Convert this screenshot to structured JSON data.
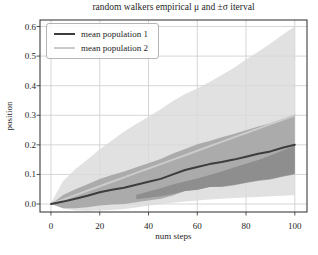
{
  "figure": {
    "background": "#ffffff",
    "spine_color": "#2b2b2b",
    "grid_color": "#cccccc",
    "text_color": "#1f1f1f"
  },
  "chart_data": {
    "type": "area",
    "title": "random walkers empirical μ and ±σ iterval",
    "xlabel": "num steps",
    "ylabel": "position",
    "grid": true,
    "xlim": [
      -4.5,
      105
    ],
    "ylim": [
      -0.027,
      0.622
    ],
    "xticks": [
      0,
      20,
      40,
      60,
      80,
      100
    ],
    "xtick_labels": [
      "0",
      "20",
      "40",
      "60",
      "80",
      "100"
    ],
    "yticks": [
      0.0,
      0.1,
      0.2,
      0.3,
      0.4,
      0.5,
      0.6
    ],
    "ytick_labels": [
      "0.0",
      "0.1",
      "0.2",
      "0.3",
      "0.4",
      "0.5",
      "0.6"
    ],
    "legend": {
      "position": "upper left",
      "entries": [
        {
          "label": "mean population 1",
          "color": "#3d3d3d"
        },
        {
          "label": "mean population 2",
          "color": "#cbcbcb"
        }
      ]
    },
    "series": [
      {
        "id": "population-2-sigma-band",
        "name": "population 2 ±σ band",
        "role": "band",
        "color": "#d9d9d9",
        "opacity": 0.8,
        "x": [
          0,
          5,
          10,
          15,
          20,
          25,
          30,
          35,
          40,
          45,
          50,
          55,
          60,
          65,
          70,
          75,
          80,
          85,
          90,
          95,
          100
        ],
        "top": [
          0.004,
          0.078,
          0.118,
          0.15,
          0.185,
          0.215,
          0.245,
          0.27,
          0.295,
          0.32,
          0.348,
          0.372,
          0.39,
          0.412,
          0.436,
          0.46,
          0.488,
          0.515,
          0.543,
          0.572,
          0.6
        ],
        "bottom": [
          0.0,
          -0.015,
          -0.022,
          -0.024,
          -0.022,
          -0.02,
          -0.017,
          -0.012,
          -0.006,
          0.0,
          0.004,
          0.008,
          0.012,
          0.015,
          0.018,
          0.02,
          0.022,
          0.024,
          0.026,
          0.028,
          0.03
        ]
      },
      {
        "id": "population-1-sigma-band",
        "name": "population 1 ±σ band",
        "role": "band",
        "color": "#a6a6a6",
        "opacity": 0.92,
        "x": [
          0,
          5,
          10,
          15,
          20,
          25,
          30,
          35,
          40,
          45,
          50,
          55,
          60,
          65,
          70,
          75,
          80,
          85,
          90,
          95,
          100
        ],
        "top": [
          0.0,
          0.03,
          0.05,
          0.067,
          0.085,
          0.098,
          0.11,
          0.124,
          0.138,
          0.152,
          0.171,
          0.186,
          0.202,
          0.213,
          0.226,
          0.237,
          0.249,
          0.262,
          0.273,
          0.287,
          0.3
        ],
        "bottom": [
          0.0,
          -0.014,
          -0.014,
          -0.011,
          -0.005,
          -0.002,
          0.0,
          0.006,
          0.012,
          0.018,
          0.029,
          0.044,
          0.048,
          0.057,
          0.058,
          0.063,
          0.071,
          0.078,
          0.083,
          0.092,
          0.1
        ]
      },
      {
        "id": "band-overlap-region",
        "name": "band overlap (darker region)",
        "role": "band",
        "color": "#8c8c8c",
        "opacity": 0.95,
        "x": [
          35,
          40,
          45,
          50,
          55,
          60,
          65,
          70,
          75,
          80,
          85,
          90,
          95,
          100
        ],
        "top": [
          0.03,
          0.042,
          0.053,
          0.066,
          0.076,
          0.086,
          0.098,
          0.11,
          0.123,
          0.136,
          0.149,
          0.164,
          0.181,
          0.197
        ],
        "bottom": [
          0.016,
          0.021,
          0.026,
          0.034,
          0.044,
          0.048,
          0.057,
          0.059,
          0.065,
          0.073,
          0.08,
          0.085,
          0.094,
          0.102
        ]
      },
      {
        "id": "mean-population-2-line",
        "name": "mean population 2",
        "role": "line",
        "color": "#cbcbcb",
        "width": 2,
        "x": [
          0,
          5,
          10,
          15,
          20,
          25,
          30,
          35,
          40,
          45,
          50,
          55,
          60,
          65,
          70,
          75,
          80,
          85,
          90,
          95,
          100
        ],
        "values": [
          0.0,
          0.015,
          0.03,
          0.045,
          0.06,
          0.075,
          0.09,
          0.105,
          0.12,
          0.135,
          0.15,
          0.165,
          0.18,
          0.195,
          0.21,
          0.225,
          0.24,
          0.255,
          0.27,
          0.285,
          0.3
        ]
      },
      {
        "id": "mean-population-1-line",
        "name": "mean population 1",
        "role": "line",
        "color": "#3d3d3d",
        "width": 2,
        "x": [
          0,
          5,
          10,
          15,
          20,
          25,
          30,
          35,
          40,
          45,
          50,
          55,
          60,
          65,
          70,
          75,
          80,
          85,
          90,
          95,
          100
        ],
        "values": [
          0.0,
          0.008,
          0.018,
          0.028,
          0.04,
          0.048,
          0.055,
          0.065,
          0.075,
          0.085,
          0.1,
          0.115,
          0.125,
          0.135,
          0.142,
          0.15,
          0.16,
          0.17,
          0.178,
          0.19,
          0.2
        ]
      }
    ]
  }
}
